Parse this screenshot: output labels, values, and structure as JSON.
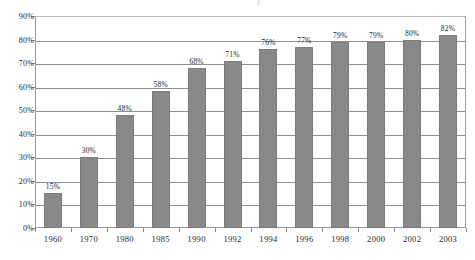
{
  "chart_data": {
    "type": "bar",
    "title": "",
    "xlabel": "",
    "ylabel": "",
    "categories": [
      "1960",
      "1970",
      "1980",
      "1985",
      "1990",
      "1992",
      "1994",
      "1996",
      "1998",
      "2000",
      "2002",
      "2003"
    ],
    "values": [
      15,
      30,
      48,
      58,
      68,
      71,
      76,
      77,
      79,
      79,
      80,
      82
    ],
    "data_labels": [
      "15%",
      "30%",
      "48%",
      "58%",
      "68%",
      "71%",
      "76%",
      "77%",
      "79%",
      "79%",
      "80%",
      "82%"
    ],
    "ylim": [
      0,
      90
    ],
    "ytick_values": [
      0,
      10,
      20,
      30,
      40,
      50,
      60,
      70,
      80,
      90
    ],
    "ytick_labels": [
      "0%",
      "10%",
      "20%",
      "30%",
      "40%",
      "50%",
      "60%",
      "70%",
      "80%",
      "90%"
    ],
    "grid": true,
    "legend": false,
    "legend_position": "none",
    "series": [
      {
        "name": "",
        "values": [
          15,
          30,
          48,
          58,
          68,
          71,
          76,
          77,
          79,
          79,
          80,
          82
        ]
      }
    ],
    "colors": {
      "bar_fill": "#898989",
      "bar_stroke": "#7c7c7c",
      "gridline": "#8f8f8f",
      "axis": "#9a9a9a",
      "text": "#1f1f1f",
      "background": "#ffffff"
    }
  }
}
